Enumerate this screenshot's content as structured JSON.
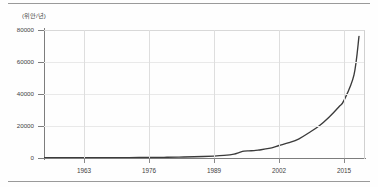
{
  "chart_data": {
    "type": "line",
    "title": "",
    "subtitle": "",
    "unit_label": "(위안/년)",
    "xlabel": "",
    "ylabel": "",
    "xlim": [
      1955,
      2019
    ],
    "ylim": [
      0,
      80000
    ],
    "grid": true,
    "legend": "none",
    "x_ticks": [
      "1963",
      "1976",
      "1989",
      "2002",
      "2015"
    ],
    "x_tick_values": [
      1963,
      1976,
      1989,
      2002,
      2015
    ],
    "y_ticks": [
      "0",
      "20000",
      "40000",
      "60000",
      "80000"
    ],
    "y_tick_values": [
      0,
      20000,
      40000,
      60000,
      80000
    ],
    "series": [
      {
        "name": "연간 소득",
        "color": "#3b3b3b",
        "x": [
          1955,
          1958,
          1961,
          1963,
          1966,
          1969,
          1972,
          1976,
          1979,
          1982,
          1985,
          1989,
          1991,
          1993,
          1994,
          1995,
          1996,
          1997,
          1998,
          2000,
          2002,
          2004,
          2006,
          2008,
          2010,
          2012,
          2014,
          2015,
          2017,
          2018
        ],
        "values": [
          180,
          190,
          200,
          210,
          230,
          250,
          270,
          320,
          420,
          560,
          780,
          1200,
          1600,
          2400,
          3400,
          4300,
          4500,
          4600,
          5000,
          6000,
          7800,
          9600,
          12000,
          15800,
          20000,
          25500,
          32000,
          36000,
          52000,
          76000
        ]
      }
    ]
  },
  "axis": {
    "y_unit": "(위안/년)"
  }
}
